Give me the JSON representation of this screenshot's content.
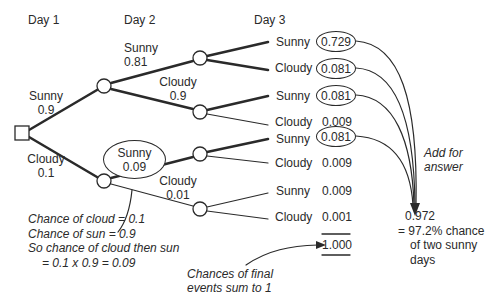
{
  "headers": {
    "day1": "Day 1",
    "day2": "Day 2",
    "day3": "Day 3"
  },
  "day1_branches": {
    "sunny": {
      "label": "Sunny",
      "prob": "0.9"
    },
    "cloudy": {
      "label": "Cloudy",
      "prob": "0.1"
    }
  },
  "day2_branches": {
    "from_sunny": {
      "sunny": {
        "label": "Sunny",
        "prob": "0.81"
      },
      "cloudy": {
        "label": "Cloudy",
        "prob": "0.9"
      }
    },
    "from_cloudy": {
      "sunny": {
        "label": "Sunny",
        "prob": "0.09"
      },
      "cloudy": {
        "label": "Cloudy",
        "prob": "0.01"
      }
    }
  },
  "outcomes": [
    {
      "label": "Sunny",
      "value": "0.729",
      "circled": true
    },
    {
      "label": "Cloudy",
      "value": "0.081",
      "circled": true
    },
    {
      "label": "Sunny",
      "value": "0.081",
      "circled": true
    },
    {
      "label": "Cloudy",
      "value": "0.009",
      "circled": false
    },
    {
      "label": "Sunny",
      "value": "0.081",
      "circled": true
    },
    {
      "label": "Cloudy",
      "value": "0.009",
      "circled": false
    },
    {
      "label": "Sunny",
      "value": "0.009",
      "circled": false
    },
    {
      "label": "Cloudy",
      "value": "0.001",
      "circled": false
    }
  ],
  "total": "1.000",
  "annotations": {
    "add_for_answer": [
      "Add for",
      "answer"
    ],
    "result": [
      "0.972",
      "= 97.2% chance",
      "of two sunny",
      "days"
    ],
    "explanation": [
      "Chance of cloud = 0.1",
      "Chance of sun = 0.9",
      "So chance of cloud then sun",
      "= 0.1 x 0.9 = 0.09"
    ],
    "sum_note": [
      "Chances of final",
      "events sum to 1"
    ]
  },
  "colors": {
    "ink": "#2a2a2a",
    "background": "#ffffff"
  }
}
